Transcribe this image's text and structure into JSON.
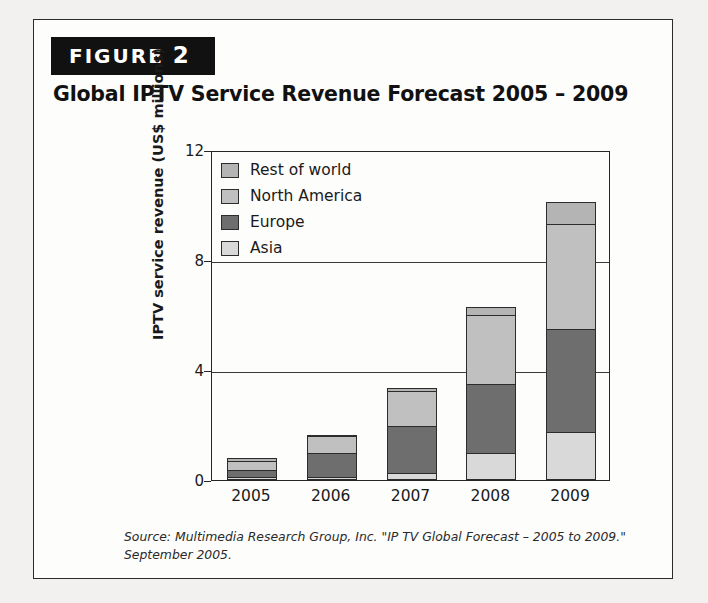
{
  "figure": {
    "badge_label": "FIGURE",
    "badge_number": "2",
    "title": "Global IPTV Service Revenue Forecast 2005 – 2009",
    "source_note": "Source: Multimedia Research Group, Inc. \"IP TV Global Forecast – 2005 to 2009.\" September 2005."
  },
  "colors": {
    "rest_of_world": "#b4b4b4",
    "north_america": "#c0c0c0",
    "europe": "#6e6e6e",
    "asia": "#d9d9d9",
    "axis": "#262626",
    "badge_background": "#111111",
    "page_background": "#f2f1ef"
  },
  "chart_data": {
    "type": "bar",
    "stacked": true,
    "title": "Global IPTV Service Revenue Forecast 2005 – 2009",
    "xlabel": "",
    "ylabel": "IPTV service revenue (US$ millions)",
    "ylim": [
      0,
      12
    ],
    "yticks": [
      0,
      4,
      8,
      12
    ],
    "ytick_labels": [
      "0",
      "4",
      "8",
      "12"
    ],
    "grid": true,
    "legend_position": "top-left inside plot",
    "categories": [
      "2005",
      "2006",
      "2007",
      "2008",
      "2009"
    ],
    "series": [
      {
        "name": "Asia",
        "values": [
          0.1,
          0.12,
          0.25,
          1.0,
          1.75
        ]
      },
      {
        "name": "Europe",
        "values": [
          0.35,
          1.0,
          1.95,
          3.5,
          5.5
        ]
      },
      {
        "name": "North America",
        "values": [
          0.7,
          1.6,
          3.25,
          6.0,
          9.3
        ]
      },
      {
        "name": "Rest of world",
        "values": [
          0.8,
          1.65,
          3.35,
          6.3,
          10.1
        ]
      }
    ],
    "segment_values": {
      "2005": {
        "asia": 0.1,
        "europe": 0.25,
        "north_america": 0.35,
        "rest_of_world": 0.1
      },
      "2006": {
        "asia": 0.12,
        "europe": 0.88,
        "north_america": 0.6,
        "rest_of_world": 0.05
      },
      "2007": {
        "asia": 0.25,
        "europe": 1.7,
        "north_america": 1.3,
        "rest_of_world": 0.1
      },
      "2008": {
        "asia": 1.0,
        "europe": 2.5,
        "north_america": 2.5,
        "rest_of_world": 0.3
      },
      "2009": {
        "asia": 1.75,
        "europe": 3.75,
        "north_america": 3.8,
        "rest_of_world": 0.8
      }
    },
    "totals": [
      0.8,
      1.65,
      3.35,
      6.3,
      10.1
    ]
  },
  "legend": {
    "items": [
      {
        "label": "Rest of world",
        "key": "rest_of_world"
      },
      {
        "label": "North America",
        "key": "north_america"
      },
      {
        "label": "Europe",
        "key": "europe"
      },
      {
        "label": "Asia",
        "key": "asia"
      }
    ]
  }
}
